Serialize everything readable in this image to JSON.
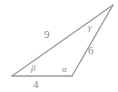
{
  "figure": {
    "kind": "geometry-triangle-diagram",
    "canvas": {
      "width": 118,
      "height": 92
    },
    "background_color": "#ffffff",
    "stroke_color": "#9a9a9a",
    "label_color": "#8a8a8a",
    "vertices": {
      "left": {
        "x": 12,
        "y": 76,
        "angle_label": "β"
      },
      "bottom_right": {
        "x": 72,
        "y": 76,
        "angle_label": "α"
      },
      "apex": {
        "x": 113,
        "y": 5,
        "angle_label": "γ"
      }
    },
    "sides": [
      {
        "name": "base",
        "from": "left",
        "to": "bottom_right",
        "label": "4"
      },
      {
        "name": "long-left",
        "from": "left",
        "to": "apex",
        "label": "9"
      },
      {
        "name": "right",
        "from": "bottom_right",
        "to": "apex",
        "label": "6"
      }
    ],
    "labels": {
      "side_base": "4",
      "side_long": "9",
      "side_right": "6",
      "angle_beta": "β",
      "angle_alpha": "α",
      "angle_gamma": "γ"
    }
  }
}
